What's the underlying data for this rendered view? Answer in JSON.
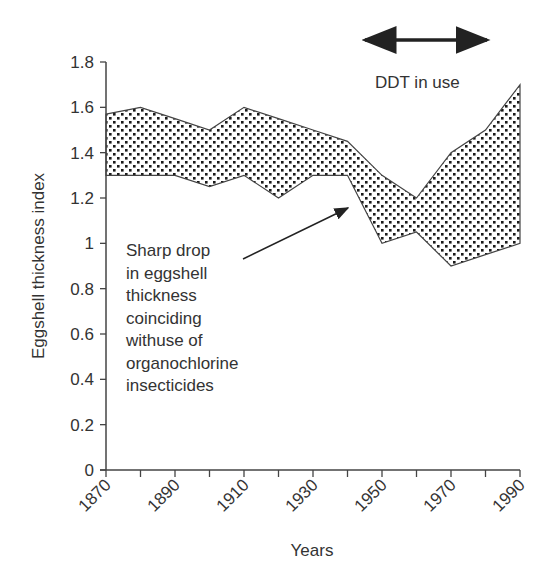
{
  "chart_data": {
    "type": "area",
    "subtype": "range-band",
    "title": "",
    "xlabel": "Years",
    "ylabel": "Eggshell thickness index",
    "x": [
      1870,
      1880,
      1890,
      1900,
      1910,
      1920,
      1930,
      1940,
      1950,
      1960,
      1970,
      1980,
      1990
    ],
    "series": [
      {
        "name": "upper",
        "values": [
          1.57,
          1.6,
          1.55,
          1.5,
          1.6,
          1.55,
          1.5,
          1.45,
          1.3,
          1.2,
          1.4,
          1.5,
          1.7
        ]
      },
      {
        "name": "lower",
        "values": [
          1.3,
          1.3,
          1.3,
          1.25,
          1.3,
          1.2,
          1.3,
          1.3,
          1.0,
          1.05,
          0.9,
          0.95,
          1.0
        ]
      }
    ],
    "xlim": [
      1870,
      1990
    ],
    "ylim": [
      0,
      1.8
    ],
    "x_ticks": [
      1870,
      1880,
      1890,
      1900,
      1910,
      1920,
      1930,
      1940,
      1950,
      1960,
      1970,
      1980,
      1990
    ],
    "x_tick_labels": [
      "1870",
      "1890",
      "1910",
      "1930",
      "1950",
      "1970",
      "1990"
    ],
    "y_ticks": [
      0,
      0.2,
      0.4,
      0.6,
      0.8,
      1,
      1.2,
      1.4,
      1.6,
      1.8
    ],
    "y_tick_labels": [
      "0",
      "0.2",
      "0.4",
      "0.6",
      "0.8",
      "1",
      "1.2",
      "1.4",
      "1.6",
      "1.8"
    ],
    "grid": false,
    "legend": null,
    "fill_pattern": "stippled dots",
    "annotations": [
      {
        "text": "DDT in use",
        "type": "double-arrow-span",
        "x_start": 1945,
        "x_end": 1980
      },
      {
        "text_lines": [
          "Sharp drop",
          "in eggshell",
          "thickness",
          "coinciding",
          "withuse of",
          "organochlorine",
          "insecticides"
        ],
        "type": "arrow",
        "points_to": {
          "x": 1940,
          "y": 1.2
        }
      }
    ]
  },
  "labels": {
    "xlabel": "Years",
    "ylabel": "Eggshell thickness index",
    "ddt": "DDT in use",
    "note_lines": [
      "Sharp drop",
      "in eggshell",
      "thickness",
      "coinciding",
      "withuse of",
      "organochlorine",
      "insecticides"
    ]
  }
}
